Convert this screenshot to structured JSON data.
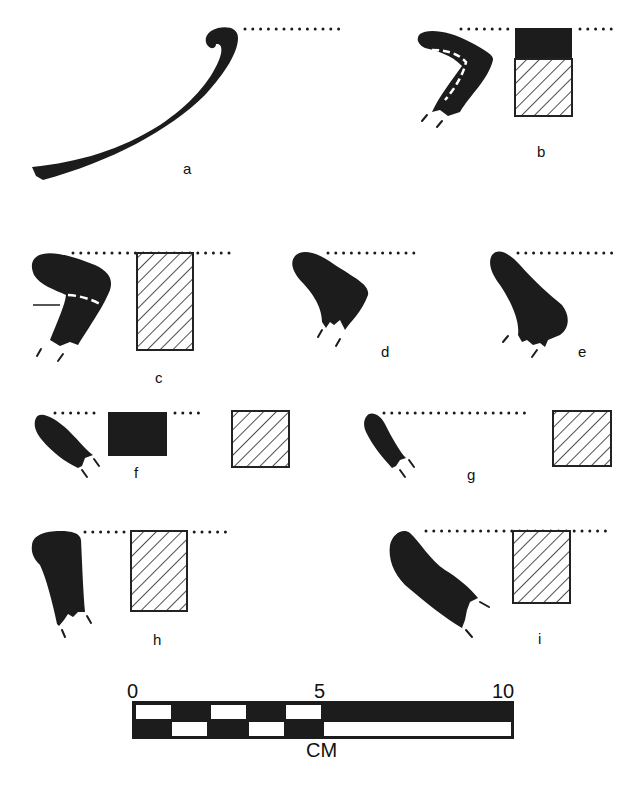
{
  "figure": {
    "type": "pottery rim profiles",
    "profiles": [
      {
        "label": "a",
        "section": "none"
      },
      {
        "label": "b",
        "section": "solid-top-hatched-bottom"
      },
      {
        "label": "c",
        "section": "hatched"
      },
      {
        "label": "d",
        "section": "none"
      },
      {
        "label": "e",
        "section": "none"
      },
      {
        "label": "f",
        "section": "solid-and-hatched"
      },
      {
        "label": "g",
        "section": "hatched"
      },
      {
        "label": "h",
        "section": "hatched"
      },
      {
        "label": "i",
        "section": "hatched"
      }
    ],
    "scale": {
      "ticks": [
        "0",
        "5",
        "10"
      ],
      "unit": "CM",
      "colors": {
        "fill": "#1c1c1c",
        "background": "#ffffff"
      }
    }
  }
}
